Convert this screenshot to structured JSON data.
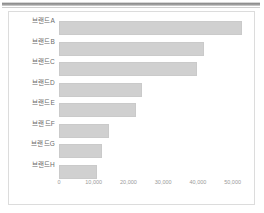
{
  "panel": {
    "background_color": "#ffffff",
    "border_color": "#dcdcdc"
  },
  "decoration": {
    "top_rule_color": "#8e8e8e"
  },
  "chart_data": {
    "type": "bar",
    "orientation": "horizontal",
    "title": "",
    "subtitle": "",
    "xlabel": "",
    "ylabel": "",
    "grid": false,
    "legend": null,
    "bar_color": "#d0d0d0",
    "bar_border_color": "#cacaca",
    "tick_label_color": "#9a9a9a",
    "category_label_color": "#6b6b6b",
    "xlim": [
      0,
      55000
    ],
    "xticks": [
      0,
      10000,
      20000,
      30000,
      40000,
      50000
    ],
    "xtick_labels": [
      "0",
      "10,000",
      "20,000",
      "30,000",
      "40,000",
      "50,000"
    ],
    "categories": [
      "브랜드A",
      "브랜드B",
      "브랜드C",
      "브랜드D",
      "브랜드E",
      "브랜드F",
      "브랜드G",
      "브랜드H"
    ],
    "values": [
      52800,
      41800,
      39800,
      23800,
      22100,
      14500,
      12500,
      11000
    ]
  }
}
